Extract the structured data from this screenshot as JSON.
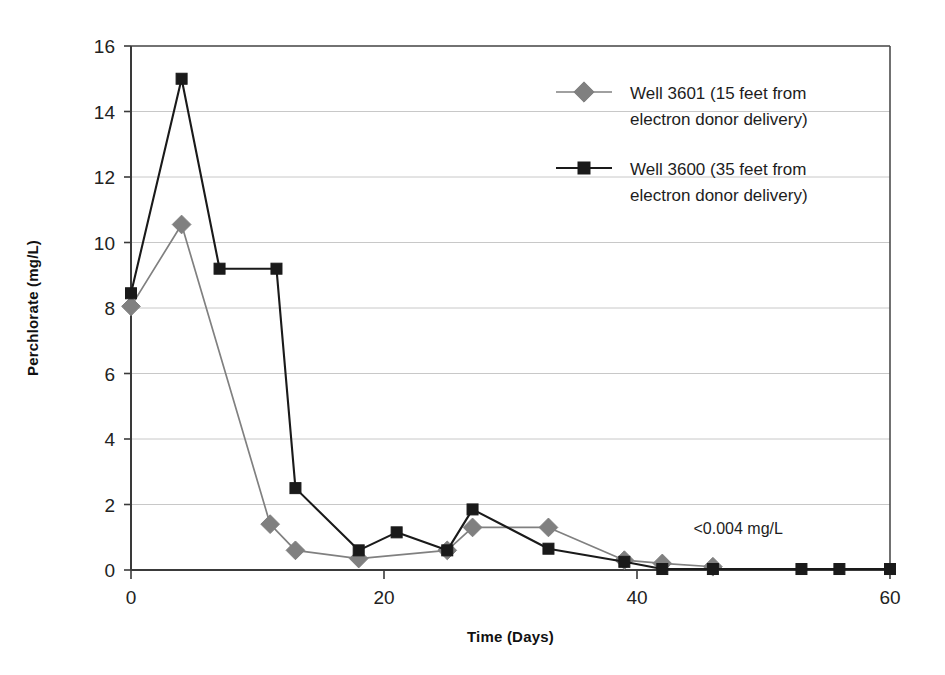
{
  "chart_data": {
    "type": "line",
    "title": "",
    "xlabel": "Time (Days)",
    "ylabel": "Perchlorate (mg/L)",
    "xlim": [
      0,
      60
    ],
    "ylim": [
      0,
      16
    ],
    "xticks": [
      0,
      20,
      40,
      60
    ],
    "yticks": [
      0,
      2,
      4,
      6,
      8,
      10,
      12,
      14,
      16
    ],
    "grid": "horizontal",
    "legend_position": "top-right inside plot area",
    "series": [
      {
        "name": "Well 3601 (15 feet from electron donor delivery)",
        "legend_line1": "Well 3601 (15 feet from",
        "legend_line2": "electron donor delivery)",
        "color": "#808080",
        "marker": "diamond",
        "x": [
          0,
          4,
          11,
          13,
          18,
          25,
          27,
          33,
          39,
          42,
          46
        ],
        "y": [
          8.05,
          10.55,
          1.4,
          0.6,
          0.35,
          0.6,
          1.3,
          1.3,
          0.3,
          0.2,
          0.1
        ]
      },
      {
        "name": "Well 3600 (35 feet from electron donor delivery)",
        "legend_line1": "Well 3600 (35 feet from",
        "legend_line2": "electron donor delivery)",
        "color": "#1a1a1a",
        "marker": "square",
        "x": [
          0,
          4,
          7,
          11.5,
          13,
          18,
          21,
          25,
          27,
          33,
          39,
          42,
          46,
          53,
          56,
          60
        ],
        "y": [
          8.45,
          15.0,
          9.2,
          9.2,
          2.5,
          0.6,
          1.15,
          0.6,
          1.85,
          0.65,
          0.25,
          0.03,
          0.03,
          0.03,
          0.03,
          0.03
        ]
      }
    ],
    "annotations": [
      {
        "text": "<0.004 mg/L",
        "x": 48,
        "y": 1.1
      }
    ]
  },
  "colors": {
    "series_1": "#808080",
    "series_2": "#1a1a1a",
    "grid": "#c8c8c8",
    "axis": "#4d4d4d",
    "background": "#ffffff"
  }
}
